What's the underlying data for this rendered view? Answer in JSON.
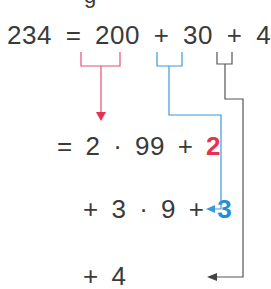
{
  "top_partial_text": "g",
  "equation": {
    "lhs": "234",
    "eq": "=",
    "terms": [
      "200",
      "+",
      "30",
      "+",
      "4"
    ]
  },
  "steps": [
    {
      "prefix": "=",
      "coef": "2",
      "dot": "·",
      "factor": "99",
      "plus": "+",
      "remainder": "2",
      "remainder_color": "#e8304f"
    },
    {
      "prefix": "+",
      "coef": "3",
      "dot": "·",
      "factor": "9",
      "plus": "+",
      "remainder": "3",
      "remainder_color": "#1f8fd6"
    },
    {
      "prefix": "+",
      "value": "4"
    }
  ],
  "colors": {
    "text": "#3a3a3a",
    "red": "#e8304f",
    "blue": "#3a9ad9",
    "gray": "#555555"
  },
  "brackets": [
    {
      "term": "200",
      "color": "red"
    },
    {
      "term": "30",
      "color": "blue"
    },
    {
      "term": "4",
      "color": "gray"
    }
  ]
}
